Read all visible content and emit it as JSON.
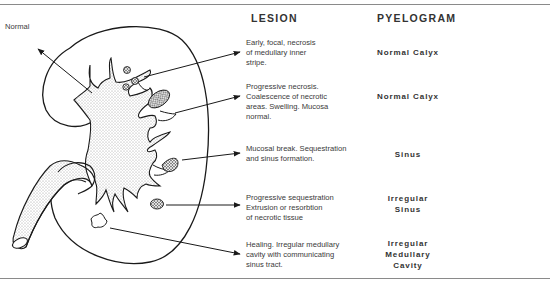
{
  "headers": {
    "lesion": "LESION",
    "pyelogram": "PYELOGRAM"
  },
  "diagram": {
    "normal_label": "Normal",
    "shading_color": "#d8d8d8",
    "line_color": "#1a1a1a"
  },
  "stages": [
    {
      "lesion": "Early, focal, necrosis\nof medullary inner\nstripe.",
      "pyelogram": "Normal Calyx"
    },
    {
      "lesion": "Progressive necrosis.\nCoalescence of necrotic\nareas. Swelling. Mucosa\nnormal.",
      "pyelogram": "Normal Calyx"
    },
    {
      "lesion": "Mucosal break. Sequestration\nand sinus formation.",
      "pyelogram": "Sinus"
    },
    {
      "lesion": "Progressive sequestration\nExtrusion or resorbtion\nof necrotic tissue",
      "pyelogram": "Irregular\nSinus"
    },
    {
      "lesion": "Healing. Irregular medullary\ncavity with communicating\nsinus tract.",
      "pyelogram": "Irregular\nMedullary\nCavity"
    }
  ]
}
